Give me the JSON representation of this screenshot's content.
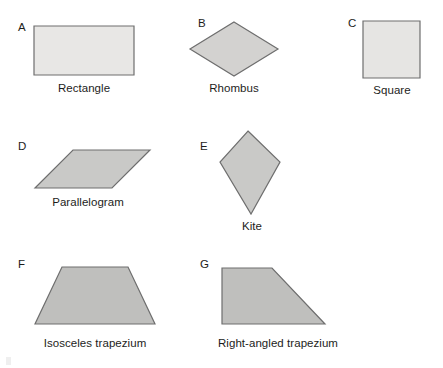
{
  "page": {
    "background_color": "#ffffff",
    "width": 443,
    "height": 368
  },
  "style": {
    "fill_light": "#e8e7e5",
    "fill_medium": "#c9c9c7",
    "stroke_color": "#6e6e6e",
    "stroke_dark": "#58585a",
    "text_color": "#1d1d1b",
    "stroke_width": 1.2
  },
  "figures": [
    {
      "key": "A",
      "caption": "Rectangle",
      "shape": "rectangle",
      "fill": "#e8e7e5",
      "points": "34,26 134,26 134,75 34,75"
    },
    {
      "key": "B",
      "caption": "Rhombus",
      "shape": "rhombus",
      "fill": "#d3d2d0",
      "points": "234,22 278,49 234,76 190,49"
    },
    {
      "key": "C",
      "caption": "Square",
      "shape": "square",
      "fill": "#e6e5e3",
      "points": "363,21 420,21 420,78 363,78"
    },
    {
      "key": "D",
      "caption": "Parallelogram",
      "shape": "parallelogram",
      "fill": "#c9c9c7",
      "points": "73,150 150,150 112,188 35,188"
    },
    {
      "key": "E",
      "caption": "Kite",
      "shape": "kite",
      "fill": "#c9c9c7",
      "points": "248,131 280,162 251,214 220,162"
    },
    {
      "key": "F",
      "caption": "Isosceles trapezium",
      "shape": "isosceles-trapezium",
      "fill": "#bfbfbd",
      "points": "62,267 128,267 155,324 35,324"
    },
    {
      "key": "G",
      "caption": "Right-angled trapezium",
      "shape": "right-angled-trapezium",
      "fill": "#bfbfbd",
      "points": "222,268 272,268 325,324 222,324"
    }
  ]
}
